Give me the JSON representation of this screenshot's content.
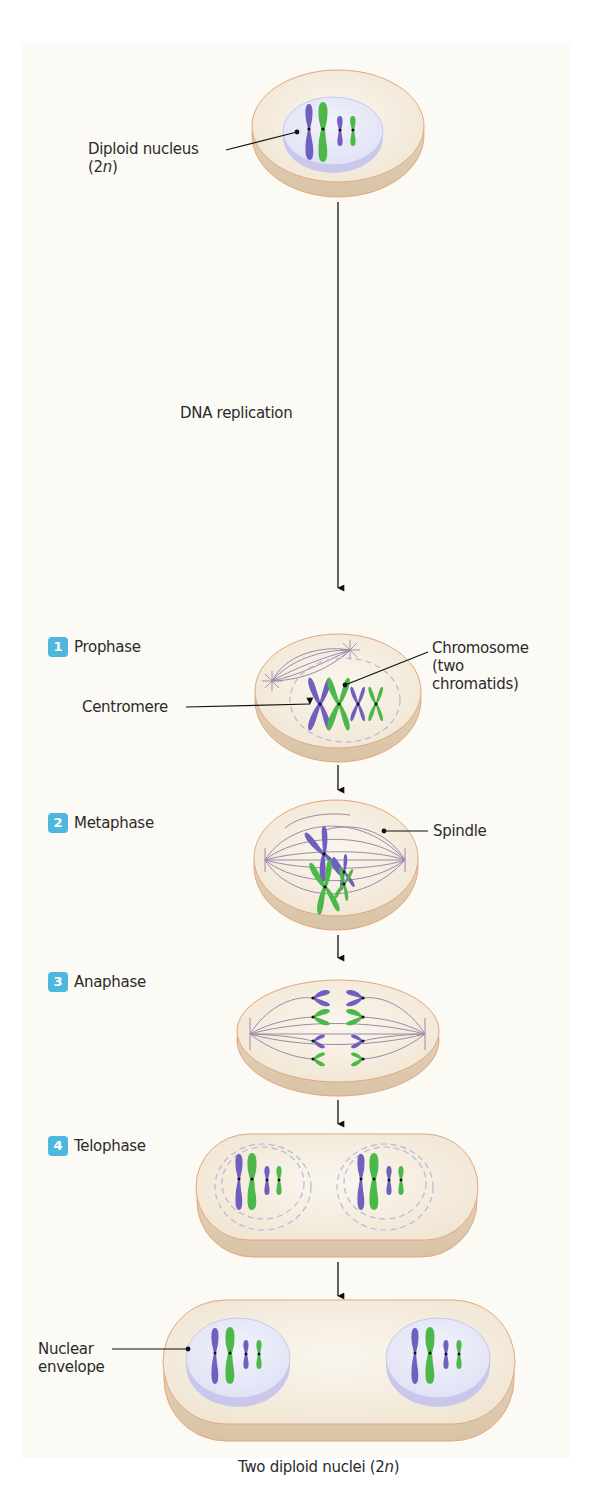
{
  "figure": {
    "colors": {
      "background_panel": "#fbfaf4",
      "cell_fill": "#f6efe3",
      "cell_rim": "#e8d6bf",
      "cell_outline": "#e3a77c",
      "nucleus_fill": "#eceef9",
      "nucleus_rim": "#c8c8ec",
      "chromosome_purple": "#6f5fbf",
      "chromosome_green": "#4cb84a",
      "spindle": "#9b8aa8",
      "badge": "#4db7dc",
      "text": "#2b2b2b",
      "arrow": "#111111"
    },
    "start": {
      "label_line1": "Diploid nucleus",
      "label_line2_prefix": "(2",
      "label_line2_italic": "n",
      "label_line2_suffix": ")"
    },
    "process_label": "DNA replication",
    "steps": [
      {
        "number": "1",
        "name": "Prophase"
      },
      {
        "number": "2",
        "name": "Metaphase"
      },
      {
        "number": "3",
        "name": "Anaphase"
      },
      {
        "number": "4",
        "name": "Telophase"
      }
    ],
    "annotations": {
      "chromosome_line1": "Chromosome",
      "chromosome_line2": "(two",
      "chromosome_line3": "chromatids)",
      "centromere": "Centromere",
      "spindle": "Spindle",
      "nuclear_envelope_line1": "Nuclear",
      "nuclear_envelope_line2": "envelope"
    },
    "result": {
      "prefix": "Two diploid nuclei (2",
      "italic": "n",
      "suffix": ")"
    }
  }
}
